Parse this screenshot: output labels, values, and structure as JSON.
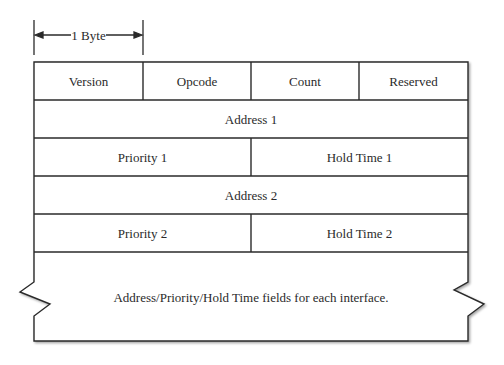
{
  "diagram": {
    "type": "packet-format",
    "scale": {
      "label": "1 Byte"
    },
    "rows": [
      {
        "fields": [
          {
            "label": "Version",
            "width_bytes": 1
          },
          {
            "label": "Opcode",
            "width_bytes": 1
          },
          {
            "label": "Count",
            "width_bytes": 1
          },
          {
            "label": "Reserved",
            "width_bytes": 1
          }
        ]
      },
      {
        "fields": [
          {
            "label": "Address 1",
            "width_bytes": 4
          }
        ]
      },
      {
        "fields": [
          {
            "label": "Priority 1",
            "width_bytes": 2
          },
          {
            "label": "Hold Time 1",
            "width_bytes": 2
          }
        ]
      },
      {
        "fields": [
          {
            "label": "Address 2",
            "width_bytes": 4
          }
        ]
      },
      {
        "fields": [
          {
            "label": "Priority 2",
            "width_bytes": 2
          },
          {
            "label": "Hold Time 2",
            "width_bytes": 2
          }
        ]
      },
      {
        "fields": [
          {
            "label": "Address/Priority/Hold Time fields for each interface.",
            "width_bytes": 4,
            "continuation": true
          }
        ]
      }
    ],
    "colors": {
      "line": "#2a2a2a",
      "text": "#2a2a2a",
      "background": "#ffffff"
    }
  }
}
